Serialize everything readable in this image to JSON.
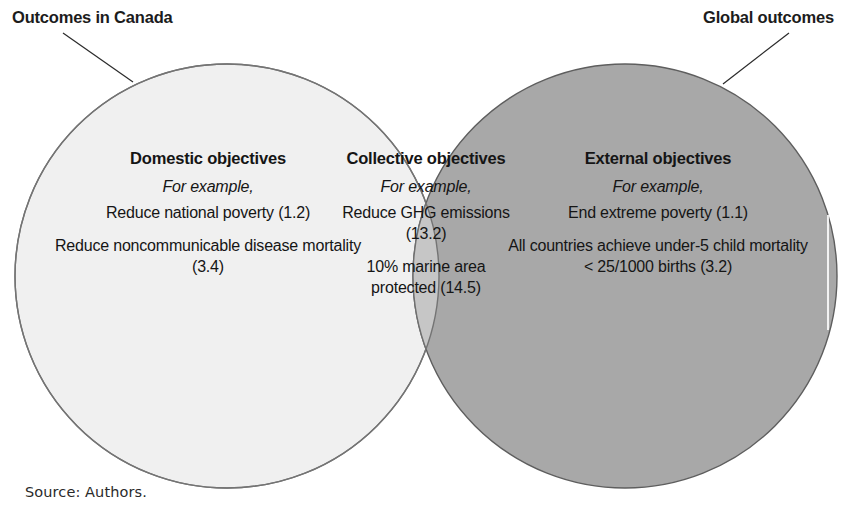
{
  "figure": {
    "source_note": "Source: Authors.",
    "colors": {
      "left_circle_fill": "#f0f0f0",
      "right_circle_fill": "#a8a8a8",
      "overlap_fill": "#c6c6c6",
      "circle_stroke": "#6f6f6f",
      "text": "#151515",
      "background": "#ffffff"
    }
  },
  "callouts": {
    "left": {
      "label": "Outcomes in Canada"
    },
    "right": {
      "label": "Global outcomes"
    }
  },
  "columns": {
    "domestic": {
      "heading": "Domestic objectives",
      "example_label": "For example,",
      "items": [
        "Reduce national poverty (1.2)",
        "Reduce noncommunicable disease mortality (3.4)"
      ]
    },
    "collective": {
      "heading": "Collective objectives",
      "example_label": "For example,",
      "items": [
        "Reduce GHG emissions (13.2)",
        "10% marine area protected (14.5)"
      ]
    },
    "external": {
      "heading": "External objectives",
      "example_label": "For example,",
      "items": [
        "End extreme poverty (1.1)",
        "All countries achieve under-5 child mortality < 25/1000 births (3.2)"
      ]
    }
  }
}
